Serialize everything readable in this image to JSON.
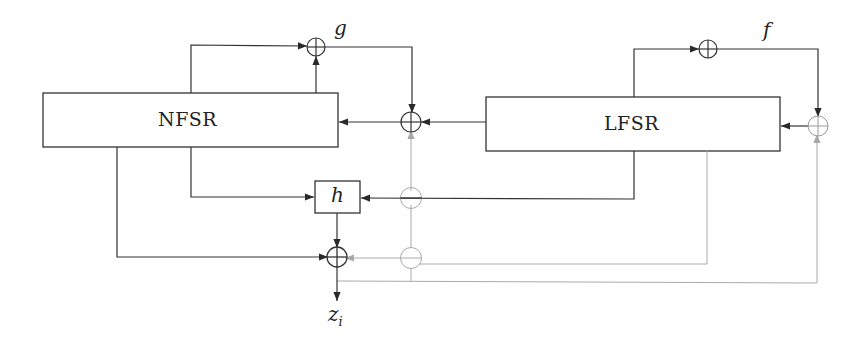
{
  "diagram": {
    "type": "block-diagram",
    "title": "",
    "colors": {
      "stroke": "#333333",
      "faint": "#aaaaaa",
      "background": "#ffffff"
    },
    "blocks": [
      {
        "id": "nfsr",
        "label": "NFSR"
      },
      {
        "id": "lfsr",
        "label": "LFSR"
      },
      {
        "id": "h",
        "label": "h"
      }
    ],
    "functions": {
      "g": "g",
      "f": "f"
    },
    "output": {
      "symbol": "z",
      "subscript": "i"
    },
    "xor_nodes": [
      {
        "id": "xor-g",
        "style": "solid"
      },
      {
        "id": "xor-f",
        "style": "solid"
      },
      {
        "id": "xor-nfsr-feedback",
        "style": "solid"
      },
      {
        "id": "xor-lfsr-feedback",
        "style": "faint"
      },
      {
        "id": "xor-output",
        "style": "solid"
      }
    ],
    "crossing_circles": [
      {
        "id": "crossing-h-line",
        "style": "faint"
      },
      {
        "id": "crossing-output-line",
        "style": "faint"
      }
    ],
    "edges": [
      {
        "from": "nfsr",
        "to": "xor-g",
        "style": "solid"
      },
      {
        "from": "xor-g",
        "to": "xor-nfsr-feedback",
        "style": "solid"
      },
      {
        "from": "lfsr",
        "to": "xor-nfsr-feedback",
        "style": "solid"
      },
      {
        "from": "xor-nfsr-feedback",
        "to": "nfsr",
        "style": "solid"
      },
      {
        "from": "lfsr",
        "to": "xor-f",
        "style": "solid"
      },
      {
        "from": "xor-f",
        "to": "xor-lfsr-feedback",
        "style": "solid"
      },
      {
        "from": "xor-lfsr-feedback",
        "to": "lfsr",
        "style": "solid"
      },
      {
        "from": "nfsr",
        "to": "h",
        "style": "solid"
      },
      {
        "from": "lfsr",
        "to": "h",
        "style": "solid"
      },
      {
        "from": "h",
        "to": "xor-output",
        "style": "solid"
      },
      {
        "from": "nfsr",
        "to": "xor-output",
        "style": "solid"
      },
      {
        "from": "lfsr",
        "to": "xor-output",
        "style": "faint"
      },
      {
        "from": "xor-output",
        "to": "xor-lfsr-feedback",
        "style": "faint"
      },
      {
        "from": "xor-output",
        "to": "xor-nfsr-feedback",
        "style": "faint"
      },
      {
        "from": "xor-output",
        "to": "z_i",
        "style": "solid"
      }
    ]
  }
}
